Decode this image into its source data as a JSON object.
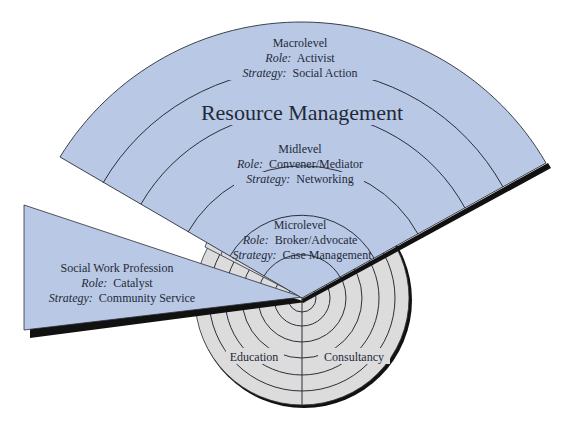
{
  "colors": {
    "fan_fill": "#b9c8e4",
    "gray_fill": "#dcdcdc",
    "stroke": "#2a2f3a",
    "shadow": "#111111",
    "text": "#1f2a3a",
    "background": "#ffffff"
  },
  "title": "Resource Management",
  "levels": [
    {
      "name": "Macrolevel",
      "role_label": "Role:",
      "role": "Activist",
      "strategy_label": "Strategy:",
      "strategy": "Social Action"
    },
    {
      "name": "Midlevel",
      "role_label": "Role:",
      "role": "Convener/Mediator",
      "strategy_label": "Strategy:",
      "strategy": "Networking"
    },
    {
      "name": "Microlevel",
      "role_label": "Role:",
      "role": "Broker/Advocate",
      "strategy_label": "Strategy:",
      "strategy": "Case Management"
    }
  ],
  "profession": {
    "name": "Social Work Profession",
    "role_label": "Role:",
    "role": "Catalyst",
    "strategy_label": "Strategy:",
    "strategy": "Community Service"
  },
  "base_sections": [
    {
      "label": "Education"
    },
    {
      "label": "Consultancy"
    }
  ]
}
